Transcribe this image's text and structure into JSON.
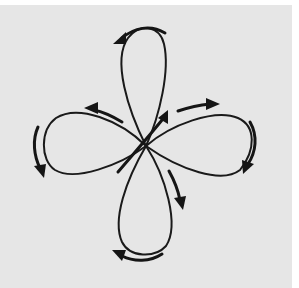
{
  "figure": {
    "background_color": "#e6e6e6",
    "stroke_color": "#1a1a1a",
    "lobes": [
      {
        "name": "top",
        "tip": [
          140,
          27
        ]
      },
      {
        "name": "right",
        "tip": [
          252,
          140
        ]
      },
      {
        "name": "bottom",
        "tip": [
          152,
          255
        ]
      },
      {
        "name": "left",
        "tip": [
          45,
          150
        ]
      }
    ],
    "arrows": [
      {
        "name": "top-outer",
        "direction": "left"
      },
      {
        "name": "upper-left-inner",
        "direction": "up-left"
      },
      {
        "name": "left-outer",
        "direction": "down"
      },
      {
        "name": "center-up",
        "direction": "up-right"
      },
      {
        "name": "upper-right-inner",
        "direction": "right"
      },
      {
        "name": "right-outer",
        "direction": "down"
      },
      {
        "name": "lower-right-inner",
        "direction": "down"
      },
      {
        "name": "bottom-outer",
        "direction": "left"
      }
    ]
  }
}
